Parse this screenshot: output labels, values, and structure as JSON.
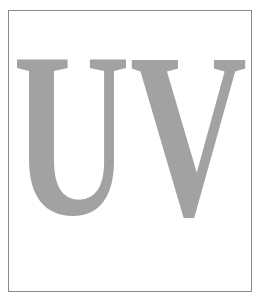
{
  "figure": {
    "text": "UV",
    "letters": [
      "U",
      "V"
    ],
    "fill_color": "#a2a2a2",
    "border_color": "#8a8a8a",
    "background_color": "#ffffff"
  }
}
